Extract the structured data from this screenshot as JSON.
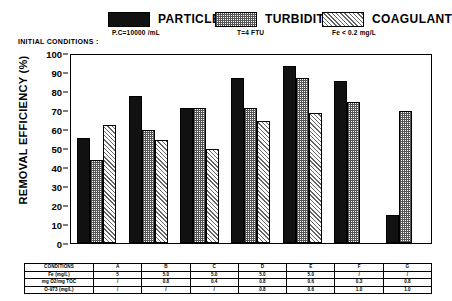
{
  "legend": {
    "initial_conditions_label": "INITIAL CONDITIONS :",
    "items": [
      {
        "name": "particles-legend",
        "label": "PARTICLES",
        "sub": "P.C=10000 /mL",
        "pattern": "solid-black",
        "color": "#111111"
      },
      {
        "name": "turbidity-legend",
        "label": "TURBIDITY",
        "sub": "T=4 FTU",
        "pattern": "dotted-grey",
        "color": "#555555"
      },
      {
        "name": "coagulant-legend",
        "label": "COAGULANT",
        "sub": "Fe < 0.2 mg/L",
        "pattern": "diagonal-hatch",
        "color": "#666666"
      }
    ]
  },
  "axis": {
    "ylabel": "REMOVAL EFFICIENCY (%)",
    "yticks": [
      "0",
      "10",
      "20",
      "30",
      "40",
      "50",
      "60",
      "70",
      "80",
      "90",
      "100"
    ],
    "zero_label": "0"
  },
  "chart_data": {
    "type": "bar",
    "title": "",
    "xlabel": "",
    "ylabel": "REMOVAL EFFICIENCY (%)",
    "ylim": [
      0,
      100
    ],
    "ytick_step": 10,
    "grid": false,
    "legend_position": "top",
    "categories": [
      "A",
      "B",
      "C",
      "D",
      "E",
      "F",
      "G"
    ],
    "series": [
      {
        "name": "PARTICLES",
        "pattern": "solid-black",
        "values": [
          56,
          78,
          72,
          88,
          94,
          86,
          15
        ]
      },
      {
        "name": "TURBIDITY",
        "pattern": "dotted-grey",
        "values": [
          44,
          60,
          72,
          72,
          88,
          75,
          70
        ]
      },
      {
        "name": "COAGULANT",
        "pattern": "diagonal-hatch",
        "values": [
          63,
          55,
          50,
          65,
          69,
          null,
          null
        ]
      }
    ]
  },
  "conditions_table": {
    "row_headers": [
      "CONDITIONS",
      "Fe (mg/L)",
      "mg O2/mg TOC",
      "O-973 (mg/L)"
    ],
    "columns": [
      "A",
      "B",
      "C",
      "D",
      "E",
      "F",
      "G"
    ],
    "rows": [
      {
        "label": "CONDITIONS",
        "values": [
          "A",
          "B",
          "C",
          "D",
          "E",
          "F",
          "G"
        ]
      },
      {
        "label": "Fe (mg/L)",
        "values": [
          "5",
          "5.0",
          "5.0",
          "5.0",
          "5.0",
          "/",
          "/"
        ]
      },
      {
        "label": "mg O2/mg TOC",
        "values": [
          "/",
          "0.8",
          "0.4",
          "0.8",
          "0.6",
          "0.3",
          "0.8"
        ]
      },
      {
        "label": "O-973 (mg/L)",
        "values": [
          "/",
          "/",
          "/",
          "0.8",
          "0.6",
          "1.0",
          "1.0"
        ]
      }
    ]
  }
}
